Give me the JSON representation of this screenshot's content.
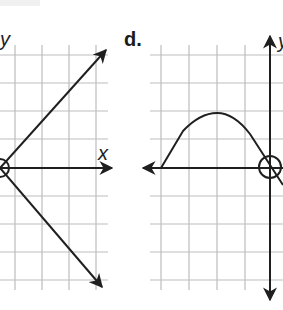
{
  "panels": [
    {
      "id": "c",
      "label": "",
      "x_label": "x",
      "y_label": "y",
      "description": "Two rays from a circled point on the x-axis at the left edge: one rising up-right, one falling down-right, with x-axis arrow to the right"
    },
    {
      "id": "d",
      "label": "d.",
      "x_label": "",
      "y_label": "y",
      "description": "Curve starting on x-axis, arching up to a maximum, then descending through an open circle at the origin and continuing downward; x-axis arrow points left, y-axis arrows up and down"
    }
  ],
  "colors": {
    "grid": "#bdbdbd",
    "ink": "#1f1f1f",
    "background": "#ffffff"
  }
}
